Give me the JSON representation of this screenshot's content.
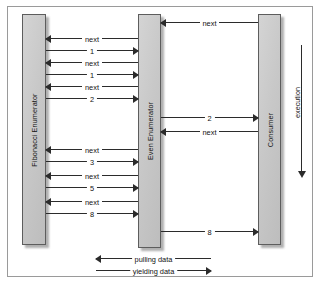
{
  "diagram": {
    "type": "uml-sequence-diagram",
    "background_color": "#ffffff",
    "border_color": "#9a9a9a",
    "line_color": "#2b2b2b",
    "lifeline_fill": "#c8c8c8",
    "lifelines": [
      {
        "id": "fibonacci",
        "label": "Fibonacci Enumerator",
        "x": 22,
        "y": 14,
        "width": 24,
        "height": 231
      },
      {
        "id": "even",
        "label": "Even Enumerator",
        "x": 138,
        "y": 14,
        "width": 23,
        "height": 234
      },
      {
        "id": "consumer",
        "label": "Consumer",
        "x": 258,
        "y": 14,
        "width": 23,
        "height": 231
      }
    ],
    "messages": [
      {
        "id": "m01",
        "label": "next",
        "direction": "left",
        "from": "consumer",
        "to": "even",
        "x": 161,
        "width": 97,
        "y": 17
      },
      {
        "id": "m02",
        "label": "next",
        "direction": "left",
        "from": "even",
        "to": "fibonacci",
        "x": 46,
        "width": 92,
        "y": 33
      },
      {
        "id": "m03",
        "label": "1",
        "direction": "right",
        "from": "fibonacci",
        "to": "even",
        "x": 46,
        "width": 92,
        "y": 45
      },
      {
        "id": "m04",
        "label": "next",
        "direction": "left",
        "from": "even",
        "to": "fibonacci",
        "x": 46,
        "width": 92,
        "y": 57
      },
      {
        "id": "m05",
        "label": "1",
        "direction": "right",
        "from": "fibonacci",
        "to": "even",
        "x": 46,
        "width": 92,
        "y": 69
      },
      {
        "id": "m06",
        "label": "next",
        "direction": "left",
        "from": "even",
        "to": "fibonacci",
        "x": 46,
        "width": 92,
        "y": 81
      },
      {
        "id": "m07",
        "label": "2",
        "direction": "right",
        "from": "fibonacci",
        "to": "even",
        "x": 46,
        "width": 92,
        "y": 93
      },
      {
        "id": "m08",
        "label": "2",
        "direction": "right",
        "from": "even",
        "to": "consumer",
        "x": 161,
        "width": 97,
        "y": 112
      },
      {
        "id": "m09",
        "label": "next",
        "direction": "left",
        "from": "consumer",
        "to": "even",
        "x": 161,
        "width": 97,
        "y": 126
      },
      {
        "id": "m10",
        "label": "next",
        "direction": "left",
        "from": "even",
        "to": "fibonacci",
        "x": 46,
        "width": 92,
        "y": 144
      },
      {
        "id": "m11",
        "label": "3",
        "direction": "right",
        "from": "fibonacci",
        "to": "even",
        "x": 46,
        "width": 92,
        "y": 156
      },
      {
        "id": "m12",
        "label": "next",
        "direction": "left",
        "from": "even",
        "to": "fibonacci",
        "x": 46,
        "width": 92,
        "y": 170
      },
      {
        "id": "m13",
        "label": "5",
        "direction": "right",
        "from": "fibonacci",
        "to": "even",
        "x": 46,
        "width": 92,
        "y": 182
      },
      {
        "id": "m14",
        "label": "next",
        "direction": "left",
        "from": "even",
        "to": "fibonacci",
        "x": 46,
        "width": 92,
        "y": 196
      },
      {
        "id": "m15",
        "label": "8",
        "direction": "right",
        "from": "fibonacci",
        "to": "even",
        "x": 46,
        "width": 92,
        "y": 208
      },
      {
        "id": "m16",
        "label": "8",
        "direction": "right",
        "from": "even",
        "to": "consumer",
        "x": 161,
        "width": 97,
        "y": 226
      }
    ],
    "execution_axis": {
      "label": "execution",
      "direction": "down"
    },
    "legend": [
      {
        "id": "pulling",
        "label": "pulling data",
        "direction": "left",
        "y": 253
      },
      {
        "id": "yielding",
        "label": "yielding data",
        "direction": "right",
        "y": 265
      }
    ]
  }
}
